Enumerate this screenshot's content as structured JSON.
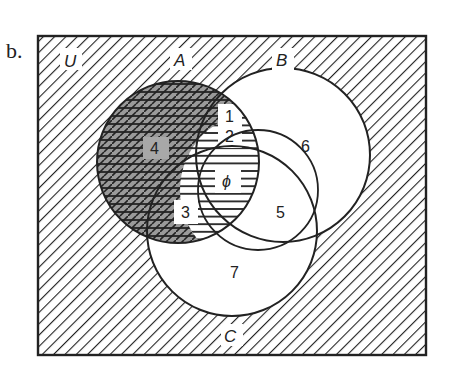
{
  "figure": {
    "part_label": "b.",
    "universe_label": "U",
    "sets": [
      {
        "name": "A",
        "label": "A"
      },
      {
        "name": "B",
        "label": "B"
      },
      {
        "name": "C",
        "label": "C"
      }
    ],
    "regions": {
      "r1": "1",
      "r2": "2",
      "r3": "3",
      "r4": "4",
      "r5": "5",
      "r6": "6",
      "r7": "7",
      "r_empty": "ϕ"
    },
    "shading": {
      "universe_outside": "diagonal hatch",
      "region_4": "dark crosshatch (gray fill)",
      "set_A_rest": "horizontal lines",
      "colors": {
        "ink": "#222222",
        "dark_fill": "#9a9a9a",
        "paper": "#ffffff"
      }
    }
  }
}
